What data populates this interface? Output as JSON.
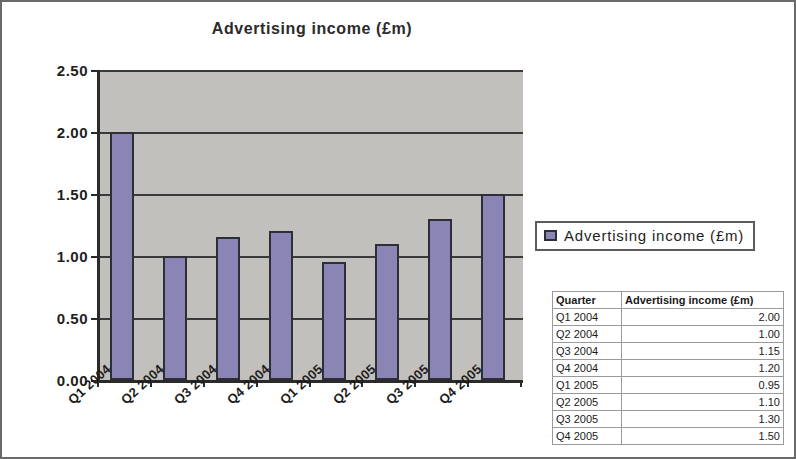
{
  "chart_data": {
    "type": "bar",
    "title": "Advertising income (£m)",
    "xlabel": "",
    "ylabel": "",
    "ylim": [
      0,
      2.5
    ],
    "ytick_step": 0.5,
    "ytick_labels": [
      "2.50",
      "2.00",
      "1.50",
      "1.00",
      "0.50",
      "0.00"
    ],
    "grid": true,
    "legend_position": "right",
    "categories": [
      "Q1 2004",
      "Q2 2004",
      "Q3 2004",
      "Q4 2004",
      "Q1 2005",
      "Q2 2005",
      "Q3 2005",
      "Q4 2005"
    ],
    "values": [
      2.0,
      1.0,
      1.15,
      1.2,
      0.95,
      1.1,
      1.3,
      1.5
    ],
    "series": [
      {
        "name": "Advertising income (£m)",
        "values": [
          2.0,
          1.0,
          1.15,
          1.2,
          0.95,
          1.1,
          1.3,
          1.5
        ]
      }
    ],
    "colors": {
      "bar_fill": "#8b85b5",
      "bar_border": "#2e2e36",
      "plot_background": "#c2c0bd",
      "axis": "#2a2a2a",
      "gridline": "#3a3a3a"
    }
  },
  "legend": {
    "label": "Advertising income (£m)"
  },
  "table": {
    "headers": [
      "Quarter",
      "Advertising income (£m)"
    ],
    "rows": [
      {
        "quarter": "Q1 2004",
        "value": "2.00"
      },
      {
        "quarter": "Q2 2004",
        "value": "1.00"
      },
      {
        "quarter": "Q3 2004",
        "value": "1.15"
      },
      {
        "quarter": "Q4 2004",
        "value": "1.20"
      },
      {
        "quarter": "Q1 2005",
        "value": "0.95"
      },
      {
        "quarter": "Q2 2005",
        "value": "1.10"
      },
      {
        "quarter": "Q3 2005",
        "value": "1.30"
      },
      {
        "quarter": "Q4 2005",
        "value": "1.50"
      }
    ]
  }
}
